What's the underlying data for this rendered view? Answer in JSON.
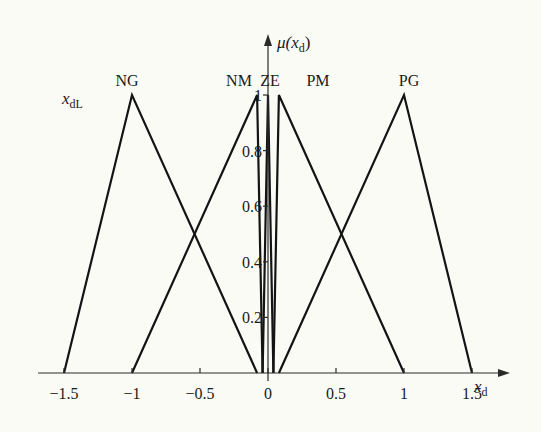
{
  "chart_data": {
    "type": "line",
    "subtype": "fuzzy-membership-functions",
    "title": "",
    "xlabel": "x_d",
    "ylabel": "μ(x_d)",
    "left_annotation": "x_dL",
    "xlim": [
      -1.5,
      1.5
    ],
    "ylim": [
      0,
      1
    ],
    "x_ticks": [
      -1.5,
      -1,
      -0.5,
      0,
      0.5,
      1,
      1.5
    ],
    "x_tick_labels": [
      "−1.5",
      "−1",
      "−0.5",
      "0",
      "0.5",
      "1",
      "1.5"
    ],
    "y_ticks": [
      0.2,
      0.4,
      0.6,
      0.8,
      1
    ],
    "y_tick_labels": [
      "0.2",
      "0.4",
      "0.6",
      "0.8",
      "1"
    ],
    "grid": false,
    "legend": "none (set names labelled above each peak)",
    "series": [
      {
        "name": "NG",
        "x": [
          -1.5,
          -1,
          -0.08
        ],
        "y": [
          0,
          1,
          0
        ]
      },
      {
        "name": "NM",
        "x": [
          -1,
          -0.08,
          -0.04
        ],
        "y": [
          0,
          1,
          0
        ]
      },
      {
        "name": "ZE",
        "x": [
          -0.04,
          0,
          0.04
        ],
        "y": [
          0,
          1,
          0
        ]
      },
      {
        "name": "PM",
        "x": [
          0.04,
          0.08,
          1
        ],
        "y": [
          0,
          1,
          0
        ]
      },
      {
        "name": "PG",
        "x": [
          0.08,
          1,
          1.5
        ],
        "y": [
          0,
          1,
          0
        ]
      }
    ]
  },
  "labels": {
    "series_names": [
      "NG",
      "NM",
      "ZE",
      "PM",
      "PG"
    ],
    "xlabel_main": "x",
    "xlabel_sub": "d",
    "ylabel_mu": "μ(",
    "ylabel_x": "x",
    "ylabel_sub": "d",
    "ylabel_close": ")",
    "left_ann_main": "x",
    "left_ann_sub": "dL"
  }
}
